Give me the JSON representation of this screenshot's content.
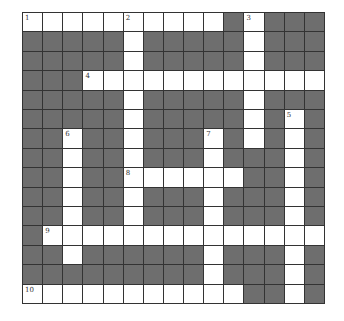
{
  "puzzle": {
    "rows": 15,
    "cols": 15,
    "colors": {
      "block": "#6e6e6e",
      "open": "#ffffff",
      "border": "#333333"
    },
    "layout": [
      "WWWWWWWWWW#W###",
      "#####W#####W###",
      "#####W#####W###",
      "###WWWWWWWWWWWW",
      "#####W#####W###",
      "#####W#####W#W#",
      "##W##W###W#W#W#",
      "##W##W###W###W#",
      "##W##WWWWWW##W#",
      "##W##W###W###W#",
      "##W##W###W###W#",
      "#WWWWWWWWWWWWWW",
      "##W######W###W#",
      "#########W###W#",
      "WWWWWWWWWWW##W#"
    ],
    "numbers": [
      {
        "row": 0,
        "col": 0,
        "label": "1"
      },
      {
        "row": 0,
        "col": 5,
        "label": "2"
      },
      {
        "row": 0,
        "col": 11,
        "label": "3"
      },
      {
        "row": 3,
        "col": 3,
        "label": "4"
      },
      {
        "row": 5,
        "col": 13,
        "label": "5"
      },
      {
        "row": 6,
        "col": 2,
        "label": "6"
      },
      {
        "row": 6,
        "col": 9,
        "label": "7"
      },
      {
        "row": 8,
        "col": 5,
        "label": "8"
      },
      {
        "row": 11,
        "col": 1,
        "label": "9"
      },
      {
        "row": 14,
        "col": 0,
        "label": "10"
      }
    ]
  }
}
